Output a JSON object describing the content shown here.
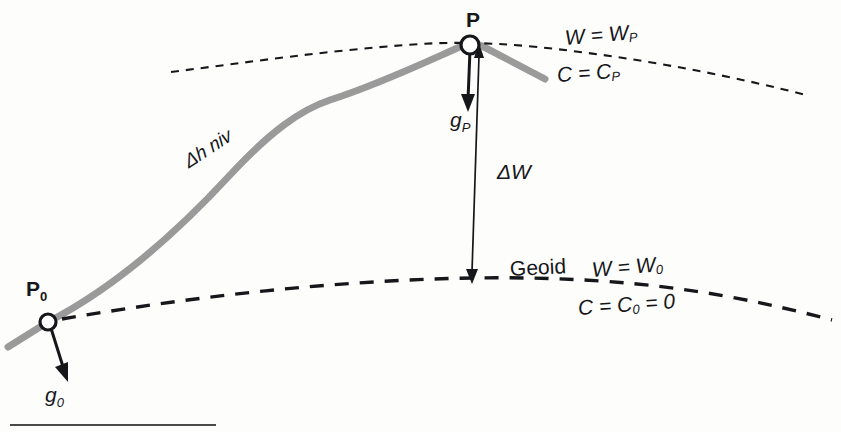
{
  "figure": {
    "type": "geodesy-leveling-diagram",
    "background_color": "#fdfdfc",
    "ink_color": "#16171a",
    "terrain_color": "#9a9a9a"
  },
  "labels": {
    "point_p": "P",
    "point_p0": "P",
    "point_p0_sub": "0",
    "gravity_p": "g",
    "gravity_p_sub": "P",
    "gravity_p0": "g",
    "gravity_p0_sub": "0",
    "delta_w": "ΔW",
    "delta_h_niv": "Δh niv",
    "geoid": "Geoid",
    "w_equals_wp": "W = W",
    "w_equals_wp_sub": "P",
    "c_equals_cp": "C = C",
    "c_equals_cp_sub": "P",
    "w_equals_w0": "W = W",
    "w_equals_w0_sub": "0",
    "c_equals_c0": "C = C",
    "c_equals_c0_sub": "0",
    "c_equals_c0_tail": " = 0"
  },
  "elements": {
    "terrain_line": "terrain-profile",
    "upper_equipotential": "equipotential-surface-through-P",
    "geoid_line": "geoid-surface",
    "plumb_line": "plumb-line-P-to-geoid",
    "footer_rule": "footer-rule"
  }
}
